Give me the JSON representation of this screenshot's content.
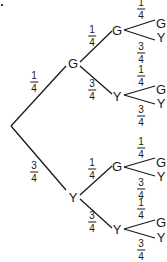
{
  "diagram": {
    "type": "probability-tree",
    "root_marker": ".",
    "level1": [
      {
        "label": "G",
        "prob_num": "1",
        "prob_den": "4"
      },
      {
        "label": "Y",
        "prob_num": "3",
        "prob_den": "4"
      }
    ],
    "level2": [
      {
        "parent": "G",
        "label": "G",
        "prob_num": "1",
        "prob_den": "4"
      },
      {
        "parent": "G",
        "label": "Y",
        "prob_num": "3",
        "prob_den": "4"
      },
      {
        "parent": "Y",
        "label": "G",
        "prob_num": "1",
        "prob_den": "4"
      },
      {
        "parent": "Y",
        "label": "Y",
        "prob_num": "3",
        "prob_den": "4"
      }
    ],
    "level3": [
      {
        "label": "G",
        "prob_num": "1",
        "prob_den": "4"
      },
      {
        "label": "Y",
        "prob_num": "3",
        "prob_den": "4"
      },
      {
        "label": "G",
        "prob_num": "1",
        "prob_den": "4"
      },
      {
        "label": "Y",
        "prob_num": "3",
        "prob_den": "4"
      },
      {
        "label": "G",
        "prob_num": "1",
        "prob_den": "4"
      },
      {
        "label": "Y",
        "prob_num": "3",
        "prob_den": "4"
      },
      {
        "label": "G",
        "prob_num": "1",
        "prob_den": "4"
      },
      {
        "label": "Y",
        "prob_num": "3",
        "prob_den": "4"
      }
    ],
    "line_color": "#1a1a1a"
  }
}
